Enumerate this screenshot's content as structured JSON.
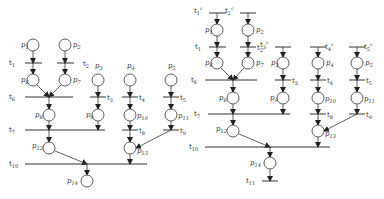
{
  "diagrams": [
    {
      "name": "petri-net-left",
      "places": [
        {
          "id": "p1",
          "label": "p1",
          "x": 33,
          "y": 45,
          "lx": -12,
          "ly": 2
        },
        {
          "id": "p2",
          "label": "p2",
          "x": 65,
          "y": 45,
          "lx": 8,
          "ly": 2
        },
        {
          "id": "p6",
          "label": "p6",
          "x": 33,
          "y": 80,
          "lx": -12,
          "ly": 2
        },
        {
          "id": "p7",
          "label": "p7",
          "x": 65,
          "y": 80,
          "lx": 8,
          "ly": 2
        },
        {
          "id": "p3",
          "label": "p3",
          "x": 98,
          "y": 80,
          "lx": -3,
          "ly": -12
        },
        {
          "id": "p4",
          "label": "p4",
          "x": 130,
          "y": 80,
          "lx": -3,
          "ly": -12
        },
        {
          "id": "p5",
          "label": "p5",
          "x": 171,
          "y": 80,
          "lx": -3,
          "ly": -12
        },
        {
          "id": "p8",
          "label": "p8",
          "x": 49,
          "y": 115,
          "lx": -14,
          "ly": 2
        },
        {
          "id": "p9",
          "label": "p9",
          "x": 98,
          "y": 115,
          "lx": -12,
          "ly": 2
        },
        {
          "id": "p10",
          "label": "p10",
          "x": 130,
          "y": 115,
          "lx": 7,
          "ly": 3
        },
        {
          "id": "p11",
          "label": "p11",
          "x": 171,
          "y": 115,
          "lx": 7,
          "ly": 3
        },
        {
          "id": "p12",
          "label": "p12",
          "x": 49,
          "y": 148,
          "lx": -17,
          "ly": 0
        },
        {
          "id": "p13",
          "label": "p13",
          "x": 130,
          "y": 148,
          "lx": 7,
          "ly": 5
        },
        {
          "id": "p14",
          "label": "p14",
          "x": 87,
          "y": 181,
          "lx": -20,
          "ly": 2
        }
      ],
      "transitions": [
        {
          "id": "t1",
          "label": "t1",
          "x1": 25,
          "x2": 42,
          "y": 63,
          "lx": -16,
          "ly": 2
        },
        {
          "id": "t2",
          "label": "t2",
          "x1": 57,
          "x2": 74,
          "y": 63,
          "lx": 19,
          "ly": 3
        },
        {
          "id": "t6",
          "label": "t6",
          "x1": 25,
          "x2": 73,
          "y": 97,
          "lx": -16,
          "ly": 2
        },
        {
          "id": "t3",
          "label": "t3",
          "x1": 90,
          "x2": 106,
          "y": 97,
          "lx": 11,
          "ly": 3
        },
        {
          "id": "t4",
          "label": "t4",
          "x1": 122,
          "x2": 138,
          "y": 97,
          "lx": 11,
          "ly": 3
        },
        {
          "id": "t5",
          "label": "t5",
          "x1": 163,
          "x2": 179,
          "y": 97,
          "lx": 11,
          "ly": 3
        },
        {
          "id": "t7",
          "label": "t7",
          "x1": 25,
          "x2": 105,
          "y": 130,
          "lx": -16,
          "ly": 2
        },
        {
          "id": "t8",
          "label": "t8",
          "x1": 122,
          "x2": 138,
          "y": 130,
          "lx": 11,
          "ly": 3
        },
        {
          "id": "t9",
          "label": "t9",
          "x1": 163,
          "x2": 179,
          "y": 130,
          "lx": 11,
          "ly": 3
        },
        {
          "id": "t10",
          "label": "t10",
          "x1": 25,
          "x2": 147,
          "y": 164,
          "lx": -16,
          "ly": 2
        }
      ],
      "arcs": [
        [
          33,
          51,
          33,
          63
        ],
        [
          33,
          63,
          33,
          74
        ],
        [
          65,
          51,
          65,
          63
        ],
        [
          65,
          63,
          65,
          74
        ],
        [
          37,
          85,
          49,
          97
        ],
        [
          61,
          85,
          49,
          97
        ],
        [
          49,
          97,
          49,
          109
        ],
        [
          49,
          121,
          49,
          130
        ],
        [
          49,
          130,
          49,
          142
        ],
        [
          55,
          151,
          87,
          164
        ],
        [
          87,
          164,
          87,
          175
        ],
        [
          98,
          86,
          98,
          97
        ],
        [
          98,
          97,
          98,
          109
        ],
        [
          98,
          121,
          98,
          130
        ],
        [
          130,
          86,
          130,
          97
        ],
        [
          130,
          97,
          130,
          109
        ],
        [
          130,
          121,
          130,
          130
        ],
        [
          130,
          130,
          130,
          142
        ],
        [
          130,
          154,
          130,
          164
        ],
        [
          171,
          86,
          171,
          97
        ],
        [
          171,
          97,
          171,
          109
        ],
        [
          171,
          121,
          171,
          130
        ],
        [
          171,
          130,
          136,
          148
        ]
      ]
    },
    {
      "name": "petri-net-right",
      "places": [
        {
          "id": "p1",
          "label": "p1",
          "x": 217,
          "y": 30,
          "lx": -12,
          "ly": 2
        },
        {
          "id": "p2",
          "label": "p2",
          "x": 248,
          "y": 30,
          "lx": 8,
          "ly": 2
        },
        {
          "id": "p6",
          "label": "p6",
          "x": 217,
          "y": 63,
          "lx": -12,
          "ly": 2
        },
        {
          "id": "p7",
          "label": "p7",
          "x": 248,
          "y": 63,
          "lx": 8,
          "ly": 2
        },
        {
          "id": "p3",
          "label": "p3",
          "x": 283,
          "y": 63,
          "lx": -12,
          "ly": 2
        },
        {
          "id": "p4",
          "label": "p4",
          "x": 318,
          "y": 63,
          "lx": 8,
          "ly": 2
        },
        {
          "id": "p5",
          "label": "p5",
          "x": 357,
          "y": 63,
          "lx": 8,
          "ly": 2
        },
        {
          "id": "p8",
          "label": "p8",
          "x": 233,
          "y": 98,
          "lx": -14,
          "ly": 2
        },
        {
          "id": "p9",
          "label": "p9",
          "x": 283,
          "y": 98,
          "lx": -13,
          "ly": 2
        },
        {
          "id": "p10",
          "label": "p10",
          "x": 318,
          "y": 98,
          "lx": 7,
          "ly": 3
        },
        {
          "id": "p11",
          "label": "p11",
          "x": 357,
          "y": 98,
          "lx": 7,
          "ly": 3
        },
        {
          "id": "p12",
          "label": "p12",
          "x": 233,
          "y": 131,
          "lx": -17,
          "ly": 0
        },
        {
          "id": "p13",
          "label": "p13",
          "x": 318,
          "y": 131,
          "lx": 7,
          "ly": 5
        },
        {
          "id": "p14",
          "label": "p14",
          "x": 270,
          "y": 163,
          "lx": -20,
          "ly": 2
        }
      ],
      "transitions": [
        {
          "id": "t1s",
          "label": "t1ˢ",
          "x1": 209,
          "x2": 226,
          "y": 13,
          "lx": -15,
          "ly": 0
        },
        {
          "id": "t2s",
          "label": "t2ˢ",
          "x1": 240,
          "x2": 256,
          "y": 13,
          "lx": -15,
          "ly": 0
        },
        {
          "id": "t1",
          "label": "t1",
          "x1": 209,
          "x2": 226,
          "y": 47,
          "lx": -14,
          "ly": 2
        },
        {
          "id": "t2",
          "label": "t2",
          "x1": 240,
          "x2": 256,
          "y": 47,
          "lx": 11,
          "ly": 3
        },
        {
          "id": "t3s",
          "label": "t3ˢ",
          "x1": 275,
          "x2": 291,
          "y": 47,
          "lx": -15,
          "ly": 0
        },
        {
          "id": "t4s",
          "label": "t4ˢ",
          "x1": 310,
          "x2": 326,
          "y": 47,
          "lx": 9,
          "ly": 2
        },
        {
          "id": "t5s",
          "label": "t5ˢ",
          "x1": 349,
          "x2": 365,
          "y": 47,
          "lx": 9,
          "ly": 2
        },
        {
          "id": "t6",
          "label": "t6",
          "x1": 205,
          "x2": 257,
          "y": 80,
          "lx": -14,
          "ly": 2
        },
        {
          "id": "t3",
          "label": "t3",
          "x1": 275,
          "x2": 291,
          "y": 80,
          "lx": 11,
          "ly": 3
        },
        {
          "id": "t4",
          "label": "t4",
          "x1": 310,
          "x2": 326,
          "y": 80,
          "lx": 11,
          "ly": 3
        },
        {
          "id": "t5",
          "label": "t5",
          "x1": 349,
          "x2": 365,
          "y": 80,
          "lx": 11,
          "ly": 3
        },
        {
          "id": "t7",
          "label": "t7",
          "x1": 208,
          "x2": 290,
          "y": 114,
          "lx": -14,
          "ly": 2
        },
        {
          "id": "t8",
          "label": "t8",
          "x1": 310,
          "x2": 326,
          "y": 114,
          "lx": 11,
          "ly": 3
        },
        {
          "id": "t9",
          "label": "t9",
          "x1": 349,
          "x2": 365,
          "y": 114,
          "lx": 11,
          "ly": 3
        },
        {
          "id": "t10",
          "label": "t10",
          "x1": 205,
          "x2": 330,
          "y": 147,
          "lx": -16,
          "ly": 2
        },
        {
          "id": "t11",
          "label": "t11",
          "x1": 262,
          "x2": 278,
          "y": 181,
          "lx": -16,
          "ly": 2
        }
      ],
      "arcs": [
        [
          217,
          13,
          217,
          24
        ],
        [
          217,
          36,
          217,
          47
        ],
        [
          217,
          47,
          217,
          57
        ],
        [
          248,
          13,
          248,
          24
        ],
        [
          248,
          36,
          248,
          47
        ],
        [
          248,
          47,
          248,
          57
        ],
        [
          221,
          68,
          233,
          80
        ],
        [
          244,
          68,
          233,
          80
        ],
        [
          233,
          80,
          233,
          92
        ],
        [
          233,
          104,
          233,
          114
        ],
        [
          233,
          114,
          233,
          125
        ],
        [
          239,
          134,
          270,
          147
        ],
        [
          270,
          147,
          270,
          157
        ],
        [
          270,
          169,
          270,
          181
        ],
        [
          283,
          47,
          283,
          57
        ],
        [
          283,
          69,
          283,
          80
        ],
        [
          283,
          80,
          283,
          92
        ],
        [
          283,
          104,
          283,
          114
        ],
        [
          318,
          47,
          318,
          57
        ],
        [
          318,
          69,
          318,
          80
        ],
        [
          318,
          80,
          318,
          92
        ],
        [
          318,
          104,
          318,
          114
        ],
        [
          318,
          114,
          318,
          125
        ],
        [
          318,
          137,
          318,
          147
        ],
        [
          357,
          47,
          357,
          57
        ],
        [
          357,
          69,
          357,
          80
        ],
        [
          357,
          80,
          357,
          92
        ],
        [
          357,
          104,
          357,
          114
        ],
        [
          357,
          114,
          324,
          131
        ]
      ]
    }
  ],
  "style": {
    "stroke": "#333333",
    "fill": "#ffffff",
    "radius": 6
  }
}
